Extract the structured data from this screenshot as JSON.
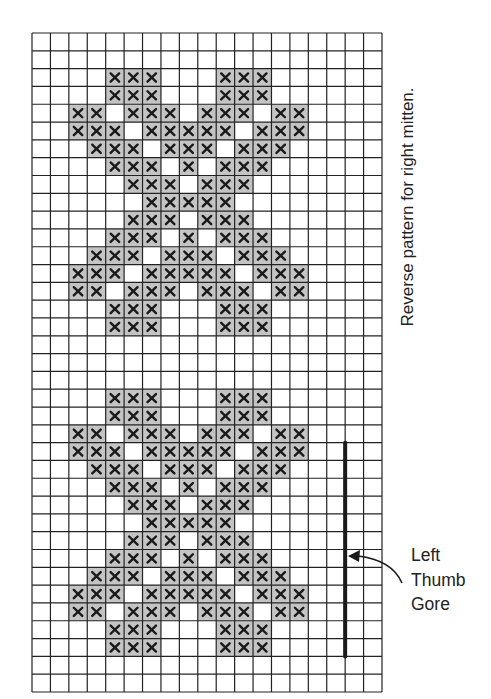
{
  "chart_data": {
    "type": "heatmap",
    "title": "",
    "grid": {
      "columns": 19,
      "rows": 37
    },
    "cell_symbol": "×",
    "colors": {
      "shaded": "#c4c4c4",
      "grid_line": "#222222",
      "empty": "#ffffff",
      "x_mark": "#1a1a1a",
      "gore_line": "#1a1a1a"
    },
    "marked_cells_by_row": [
      [],
      [],
      [
        4,
        5,
        6,
        10,
        11,
        12
      ],
      [
        4,
        5,
        6,
        10,
        11,
        12
      ],
      [
        2,
        3,
        5,
        6,
        7,
        9,
        10,
        11,
        13,
        14
      ],
      [
        2,
        3,
        4,
        6,
        7,
        8,
        9,
        10,
        12,
        13,
        14
      ],
      [
        3,
        4,
        5,
        7,
        8,
        9,
        11,
        12,
        13
      ],
      [
        4,
        5,
        6,
        8,
        10,
        11,
        12
      ],
      [
        5,
        6,
        7,
        9,
        10,
        11
      ],
      [
        6,
        7,
        8,
        9,
        10
      ],
      [
        5,
        6,
        7,
        9,
        10,
        11
      ],
      [
        4,
        5,
        6,
        8,
        10,
        11,
        12
      ],
      [
        3,
        4,
        5,
        7,
        8,
        9,
        11,
        12,
        13
      ],
      [
        2,
        3,
        4,
        6,
        7,
        8,
        9,
        10,
        12,
        13,
        14
      ],
      [
        2,
        3,
        5,
        6,
        7,
        9,
        10,
        11,
        13,
        14
      ],
      [
        4,
        5,
        6,
        10,
        11,
        12
      ],
      [
        4,
        5,
        6,
        10,
        11,
        12
      ],
      [],
      [],
      [],
      [
        4,
        5,
        6,
        10,
        11,
        12
      ],
      [
        4,
        5,
        6,
        10,
        11,
        12
      ],
      [
        2,
        3,
        5,
        6,
        7,
        9,
        10,
        11,
        13,
        14
      ],
      [
        2,
        3,
        4,
        6,
        7,
        8,
        9,
        10,
        12,
        13,
        14
      ],
      [
        3,
        4,
        5,
        7,
        8,
        9,
        11,
        12,
        13
      ],
      [
        4,
        5,
        6,
        8,
        10,
        11,
        12
      ],
      [
        5,
        6,
        7,
        9,
        10,
        11
      ],
      [
        6,
        7,
        8,
        9,
        10
      ],
      [
        5,
        6,
        7,
        9,
        10,
        11
      ],
      [
        4,
        5,
        6,
        8,
        10,
        11,
        12
      ],
      [
        3,
        4,
        5,
        7,
        8,
        9,
        11,
        12,
        13
      ],
      [
        2,
        3,
        4,
        6,
        7,
        8,
        9,
        10,
        12,
        13,
        14
      ],
      [
        2,
        3,
        5,
        6,
        7,
        9,
        10,
        11,
        13,
        14
      ],
      [
        4,
        5,
        6,
        10,
        11,
        12
      ],
      [
        4,
        5,
        6,
        10,
        11,
        12
      ],
      [],
      []
    ],
    "thumb_gore": {
      "grid_line_after_column": 16,
      "start_row": 23,
      "end_row": 34
    },
    "annotations": {
      "side_note": "Reverse pattern for right mitten.",
      "gore_label_lines": [
        "Left",
        "Thumb",
        "Gore"
      ]
    }
  }
}
